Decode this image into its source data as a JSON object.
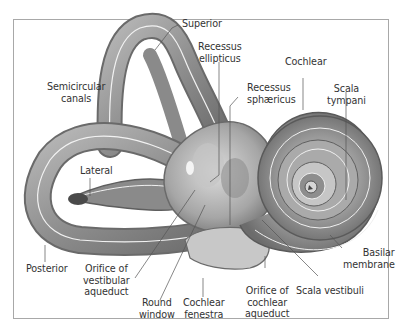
{
  "figure": {
    "labels": {
      "superior": [
        "Superior"
      ],
      "recessus_ellipticus": [
        "Recessus",
        "ellipticus"
      ],
      "cochlear": [
        "Cochlear"
      ],
      "semicircular_canals": [
        "Semicircular",
        "canals"
      ],
      "recessus_sphaericus": [
        "Recessus",
        "sphæricus"
      ],
      "scala_tympani": [
        "Scala",
        "tympani"
      ],
      "lateral": [
        "Lateral"
      ],
      "basilar_membrane": [
        "Basilar",
        "membrane"
      ],
      "posterior": [
        "Posterior"
      ],
      "orifice_vestibular_aqueduct": [
        "Orifice of",
        "vestibular",
        "aqueduct"
      ],
      "orifice_cochlear_aqueduct": [
        "Orifice of",
        "cochlear",
        "aqueduct"
      ],
      "scala_vestibuli": [
        "Scala vestibuli"
      ],
      "round_window": [
        "Round",
        "window"
      ],
      "cochlear_fenestra": [
        "Cochlear",
        "fenestra"
      ]
    },
    "colors": {
      "frame": "#a8a8a8",
      "tissue_dark": "#6e6e6e",
      "tissue_mid": "#9c9c9c",
      "tissue_light": "#d6d6d6",
      "leader_line": "#555555",
      "text": "#333333"
    }
  }
}
